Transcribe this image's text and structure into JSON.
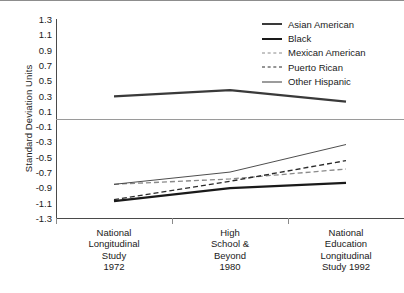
{
  "chart_data": {
    "type": "line",
    "title": "",
    "xlabel": "",
    "ylabel": "Standard Deviation Units",
    "categories": [
      "National Longitudinal Study 1972",
      "High School & Beyond 1980",
      "National Education Longitudinal Study 1992"
    ],
    "category_lines": [
      [
        "National",
        "Longitudinal",
        "Study",
        "1972"
      ],
      [
        "High",
        "School &",
        "Beyond",
        "1980"
      ],
      [
        "National",
        "Education",
        "Longitudinal",
        "Study 1992"
      ]
    ],
    "ylim": [
      -1.3,
      1.3
    ],
    "yticks": [
      1.3,
      1.1,
      0.9,
      0.7,
      0.5,
      0.3,
      0.1,
      -0.1,
      -0.3,
      -0.5,
      -0.7,
      -0.9,
      -1.1,
      -1.3
    ],
    "ytick_labels": [
      "1.3",
      "1.1",
      "0.9",
      "0.7",
      "0.5",
      "0.3",
      "0.1",
      "-0.1",
      "-0.3",
      "-0.5",
      "-0.7",
      "-0.9",
      "-1.1",
      "-1.3"
    ],
    "grid": false,
    "zero_line": true,
    "legend_position": "top-right",
    "series": [
      {
        "name": "Asian American",
        "values": [
          0.29,
          0.37,
          0.22
        ],
        "style": "solid",
        "width": 2.2,
        "color": "#3a3a3a"
      },
      {
        "name": "Black",
        "values": [
          -1.08,
          -0.91,
          -0.84
        ],
        "style": "solid",
        "width": 2.2,
        "color": "#1a1a1a"
      },
      {
        "name": "Mexican American",
        "values": [
          -0.86,
          -0.79,
          -0.66
        ],
        "style": "dashed",
        "width": 1.3,
        "color": "#8a8a8a"
      },
      {
        "name": "Puerto Rican",
        "values": [
          -1.06,
          -0.82,
          -0.55
        ],
        "style": "dashed",
        "width": 1.4,
        "color": "#2a2a2a"
      },
      {
        "name": "Other Hispanic",
        "values": [
          -0.86,
          -0.7,
          -0.34
        ],
        "style": "solid",
        "width": 0.9,
        "color": "#3a3a3a"
      }
    ]
  },
  "legend": {
    "items": [
      {
        "label": "Asian American"
      },
      {
        "label": "Black"
      },
      {
        "label": "Mexican American"
      },
      {
        "label": "Puerto Rican"
      },
      {
        "label": "Other Hispanic"
      }
    ]
  },
  "colors": {
    "axis": "#4a4a4a",
    "zero_line": "#9a9a9a",
    "text": "#1a1a1a",
    "background": "#ffffff"
  }
}
